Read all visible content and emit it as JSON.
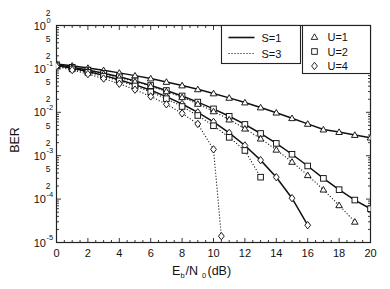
{
  "chart_data": {
    "type": "line",
    "title": "",
    "xlabel": "E_b/N_0 (dB)",
    "xlabel_parts": {
      "lead": "E",
      "sub1": "b",
      "slash": "/N",
      "sub2": "0",
      "unit": " (dB)"
    },
    "ylabel": "BER",
    "xlim": [
      0,
      20
    ],
    "ylim": [
      1e-05,
      1
    ],
    "xscale": "linear",
    "yscale": "log",
    "grid": false,
    "xticks": [
      0,
      2,
      4,
      6,
      8,
      10,
      12,
      14,
      16,
      18,
      20
    ],
    "xtick_labels": [
      "0",
      "2",
      "4",
      "6",
      "8",
      "10",
      "12",
      "14",
      "16",
      "18",
      "20"
    ],
    "xminor_step": 0.5,
    "ydecade_labels": [
      "10^0",
      "10^-1",
      "10^-2",
      "10^-3",
      "10^-4",
      "10^-5"
    ],
    "ydecade_values": [
      1,
      0.1,
      0.01,
      0.001,
      0.0001,
      1e-05
    ],
    "yminor_labels": [
      "5",
      "2"
    ],
    "legend_position": "upper right",
    "legend_groups": [
      {
        "name": "linestyle",
        "entries": [
          {
            "label": "S=1",
            "style": "solid"
          },
          {
            "label": "S=3",
            "style": "dotted"
          }
        ]
      },
      {
        "name": "marker",
        "entries": [
          {
            "label": "U=1",
            "marker": "triangle"
          },
          {
            "label": "U=2",
            "marker": "square"
          },
          {
            "label": "U=4",
            "marker": "diamond"
          }
        ]
      }
    ],
    "series": [
      {
        "name": "S=1, U=1",
        "S": 1,
        "U": 1,
        "style": "solid",
        "marker": "triangle",
        "x": [
          0,
          1,
          2,
          3,
          4,
          5,
          6,
          7,
          8,
          9,
          10,
          11,
          12,
          13,
          14,
          15,
          16,
          17,
          18,
          19,
          20
        ],
        "values": [
          0.13,
          0.118,
          0.105,
          0.093,
          0.081,
          0.07,
          0.06,
          0.05,
          0.0415,
          0.0338,
          0.0272,
          0.0215,
          0.0168,
          0.0129,
          0.0098,
          0.0073,
          0.0054,
          0.004,
          0.0035,
          0.003,
          0.0026
        ]
      },
      {
        "name": "S=1, U=2",
        "S": 1,
        "U": 2,
        "style": "solid",
        "marker": "square",
        "x": [
          0,
          1,
          2,
          3,
          4,
          5,
          6,
          7,
          8,
          9,
          10,
          11,
          12,
          13,
          14,
          15,
          16,
          17,
          18,
          19,
          20
        ],
        "values": [
          0.125,
          0.109,
          0.094,
          0.079,
          0.066,
          0.053,
          0.0415,
          0.0318,
          0.0238,
          0.0172,
          0.012,
          0.0081,
          0.00525,
          0.00325,
          0.00192,
          0.00108,
          0.00058,
          0.0003,
          0.000165,
          9.5e-05,
          6e-05
        ]
      },
      {
        "name": "S=1, U=4",
        "S": 1,
        "U": 4,
        "style": "solid",
        "marker": "diamond",
        "x": [
          0,
          1,
          2,
          3,
          4,
          5,
          6,
          7,
          8,
          9,
          10,
          11,
          12,
          13,
          14,
          15,
          16
        ],
        "values": [
          0.12,
          0.103,
          0.087,
          0.071,
          0.0565,
          0.0435,
          0.0322,
          0.0229,
          0.0155,
          0.00995,
          0.006,
          0.00335,
          0.00172,
          0.00079,
          0.00032,
          0.000105,
          2.5e-05
        ]
      },
      {
        "name": "S=3, U=1",
        "S": 3,
        "U": 1,
        "style": "dotted",
        "marker": "triangle",
        "x": [
          0,
          1,
          2,
          3,
          4,
          5,
          6,
          7,
          8,
          9,
          10,
          11,
          12,
          13,
          14,
          15,
          16,
          17,
          18,
          19
        ],
        "values": [
          0.122,
          0.106,
          0.091,
          0.077,
          0.063,
          0.051,
          0.04,
          0.0303,
          0.0222,
          0.0156,
          0.0105,
          0.0068,
          0.0042,
          0.00247,
          0.00137,
          0.00072,
          0.000355,
          0.000165,
          7.2e-05,
          3e-05
        ]
      },
      {
        "name": "S=3, U=2",
        "S": 3,
        "U": 2,
        "style": "dotted",
        "marker": "square",
        "x": [
          0,
          1,
          2,
          3,
          4,
          5,
          6,
          7,
          8,
          9,
          10,
          11,
          12,
          13
        ],
        "values": [
          0.118,
          0.1,
          0.083,
          0.068,
          0.053,
          0.0405,
          0.0296,
          0.0206,
          0.0136,
          0.00845,
          0.0049,
          0.00265,
          0.00132,
          0.00032
        ]
      },
      {
        "name": "S=3, U=4",
        "S": 3,
        "U": 4,
        "style": "dotted",
        "marker": "diamond",
        "x": [
          0,
          1,
          2,
          3,
          4,
          5,
          6,
          7,
          8,
          9,
          10,
          10.5
        ],
        "values": [
          0.114,
          0.094,
          0.076,
          0.06,
          0.0455,
          0.0333,
          0.0232,
          0.0153,
          0.00945,
          0.0054,
          0.0014,
          1.4e-05
        ]
      }
    ]
  },
  "colors": {
    "line": "#111111",
    "axis": "#222222",
    "background": "#ffffff"
  }
}
